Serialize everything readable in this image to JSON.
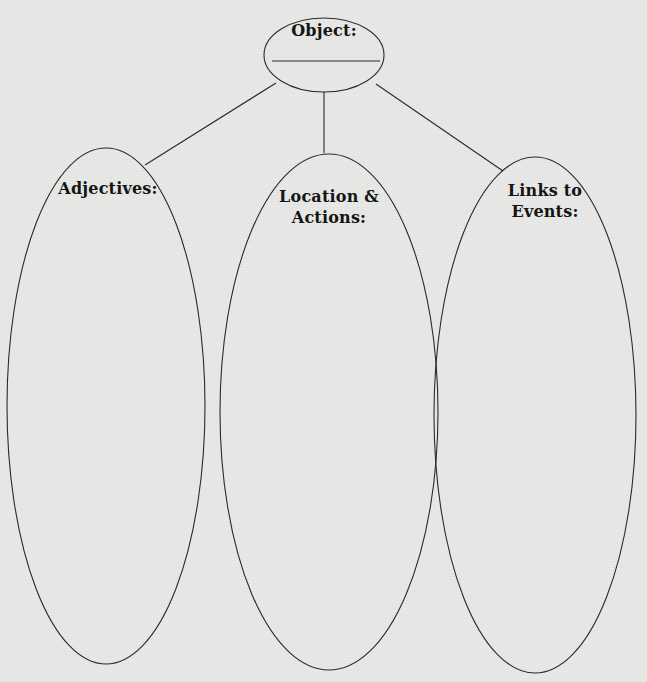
{
  "diagram": {
    "type": "graphic-organizer",
    "root": {
      "label": "Object:",
      "blank_line": true
    },
    "branches": [
      {
        "id": "adjectives",
        "label_lines": [
          "Adjectives:"
        ]
      },
      {
        "id": "location-actions",
        "label_lines": [
          "Location &",
          "Actions:"
        ]
      },
      {
        "id": "links-to-events",
        "label_lines": [
          "Links to",
          "Events:"
        ]
      }
    ],
    "colors": {
      "stroke": "#2a2a2a",
      "text": "#151515",
      "paper": "#e7e7e5"
    }
  }
}
